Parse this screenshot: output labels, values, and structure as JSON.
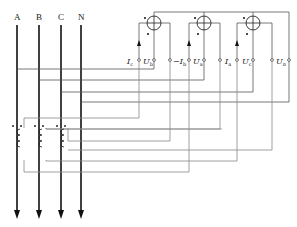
{
  "diagram": {
    "buses": [
      {
        "label": "A",
        "x": 17
      },
      {
        "label": "B",
        "x": 39
      },
      {
        "label": "C",
        "x": 61
      },
      {
        "label": "N",
        "x": 81
      }
    ],
    "meters": [
      {
        "id": "meter-1",
        "cx": 154,
        "cy": 23
      },
      {
        "id": "meter-2",
        "cx": 204,
        "cy": 23
      },
      {
        "id": "meter-3",
        "cx": 253,
        "cy": 23
      }
    ],
    "terminal_labels": [
      {
        "id": "Ic",
        "text": "I",
        "sub": "c",
        "x": 127,
        "y": 64
      },
      {
        "id": "Ub",
        "text": "U",
        "sub": "b",
        "x": 143,
        "y": 64
      },
      {
        "id": "neg-Ib",
        "text": "−I",
        "sub": "b",
        "x": 174,
        "y": 64
      },
      {
        "id": "Ua",
        "text": "U",
        "sub": "a",
        "x": 193,
        "y": 64
      },
      {
        "id": "Ia",
        "text": "I",
        "sub": "a",
        "x": 225,
        "y": 64
      },
      {
        "id": "Uc",
        "text": "U",
        "sub": "c",
        "x": 242,
        "y": 64
      },
      {
        "id": "Un",
        "text": "U",
        "sub": "n",
        "x": 276,
        "y": 64
      }
    ]
  }
}
